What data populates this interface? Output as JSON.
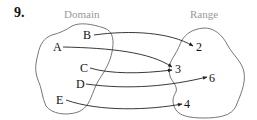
{
  "problem_number": "9.",
  "domain": {
    "title": "Domain",
    "elements": [
      {
        "label": "B",
        "x": 88,
        "y": 39
      },
      {
        "label": "A",
        "x": 56,
        "y": 51
      },
      {
        "label": "C",
        "x": 81,
        "y": 72
      },
      {
        "label": "D",
        "x": 77,
        "y": 88
      },
      {
        "label": "E",
        "x": 58,
        "y": 104
      }
    ]
  },
  "range": {
    "title": "Range",
    "elements": [
      {
        "label": "2",
        "x": 198,
        "y": 51
      },
      {
        "label": "3",
        "x": 176,
        "y": 73
      },
      {
        "label": "6",
        "x": 210,
        "y": 82
      },
      {
        "label": "4",
        "x": 185,
        "y": 108
      }
    ]
  },
  "mapping": [
    {
      "from": "B",
      "to": "2"
    },
    {
      "from": "A",
      "to": "3"
    },
    {
      "from": "C",
      "to": "3"
    },
    {
      "from": "D",
      "to": "6"
    },
    {
      "from": "E",
      "to": "4"
    }
  ],
  "colors": {
    "header_text": "#999999",
    "blob_stroke": "#777777",
    "arrow_stroke": "#222222"
  }
}
